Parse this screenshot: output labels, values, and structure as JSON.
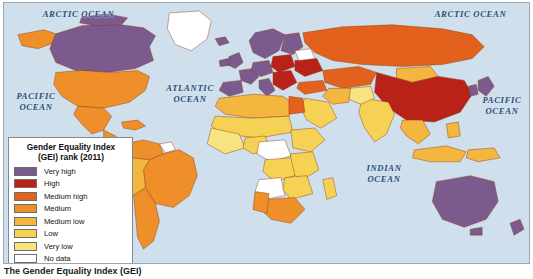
{
  "map": {
    "title": "Gender Equality Index (GEI) rank (2011)",
    "caption": "The Gender Equality Index (GEI)",
    "ocean_color": "#cfe0ec",
    "border_color": "#9aa7b4",
    "ocean_labels": [
      {
        "name": "arctic-ocean-west",
        "text": "ARCTIC  OCEAN"
      },
      {
        "name": "arctic-ocean-east",
        "text": "ARCTIC  OCEAN"
      },
      {
        "name": "pacific-ocean-west",
        "text": "PACIFIC\nOCEAN"
      },
      {
        "name": "pacific-ocean-east",
        "text": "PACIFIC\nOCEAN"
      },
      {
        "name": "atlantic-ocean",
        "text": "ATLANTIC\nOCEAN"
      },
      {
        "name": "indian-ocean",
        "text": "INDIAN\nOCEAN"
      }
    ]
  },
  "legend": {
    "title": "Gender Equality Index\n(GEI) rank (2011)",
    "items": [
      {
        "label": "Very high",
        "color": "#7b5a8e"
      },
      {
        "label": "High",
        "color": "#b92219"
      },
      {
        "label": "Medium high",
        "color": "#e2611c"
      },
      {
        "label": "Medium",
        "color": "#ef8f2a"
      },
      {
        "label": "Medium low",
        "color": "#f3b63f"
      },
      {
        "label": "Low",
        "color": "#f6d254"
      },
      {
        "label": "Very low",
        "color": "#f7e37f"
      },
      {
        "label": "No data",
        "color": "#ffffff"
      }
    ]
  },
  "chart_data": {
    "type": "map",
    "title": "Gender Equality Index (GEI) rank (2011)",
    "projection": "world-choropleth",
    "classes": [
      "Very high",
      "High",
      "Medium high",
      "Medium",
      "Medium low",
      "Low",
      "Very low",
      "No data"
    ],
    "class_colors": [
      "#7b5a8e",
      "#b92219",
      "#e2611c",
      "#ef8f2a",
      "#f3b63f",
      "#f6d254",
      "#f7e37f",
      "#ffffff"
    ],
    "regions": [
      {
        "name": "Canada",
        "class": "Very high"
      },
      {
        "name": "Greenland",
        "class": "No data"
      },
      {
        "name": "United States",
        "class": "Medium"
      },
      {
        "name": "Alaska",
        "class": "Medium"
      },
      {
        "name": "Mexico",
        "class": "Medium"
      },
      {
        "name": "Central America",
        "class": "Medium"
      },
      {
        "name": "Caribbean",
        "class": "Medium"
      },
      {
        "name": "Brazil",
        "class": "Medium"
      },
      {
        "name": "Argentina",
        "class": "Medium"
      },
      {
        "name": "Chile",
        "class": "Medium"
      },
      {
        "name": "Peru",
        "class": "Medium low"
      },
      {
        "name": "Bolivia",
        "class": "Medium low"
      },
      {
        "name": "Colombia",
        "class": "Medium"
      },
      {
        "name": "Venezuela",
        "class": "Medium"
      },
      {
        "name": "Guyana region",
        "class": "No data"
      },
      {
        "name": "Western Europe",
        "class": "Very high"
      },
      {
        "name": "Scandinavia",
        "class": "Very high"
      },
      {
        "name": "United Kingdom",
        "class": "Very high"
      },
      {
        "name": "France",
        "class": "Very high"
      },
      {
        "name": "Spain",
        "class": "Very high"
      },
      {
        "name": "Italy",
        "class": "Very high"
      },
      {
        "name": "Germany",
        "class": "Very high"
      },
      {
        "name": "Poland",
        "class": "High"
      },
      {
        "name": "Balkans",
        "class": "High"
      },
      {
        "name": "Ukraine",
        "class": "High"
      },
      {
        "name": "Belarus",
        "class": "No data"
      },
      {
        "name": "Russia",
        "class": "Medium high"
      },
      {
        "name": "Kazakhstan",
        "class": "Medium high"
      },
      {
        "name": "Mongolia",
        "class": "Medium low"
      },
      {
        "name": "China",
        "class": "High"
      },
      {
        "name": "Japan",
        "class": "Very high"
      },
      {
        "name": "Korea",
        "class": "Very high"
      },
      {
        "name": "India",
        "class": "Low"
      },
      {
        "name": "Pakistan",
        "class": "Very low"
      },
      {
        "name": "Iran",
        "class": "Medium low"
      },
      {
        "name": "Turkey",
        "class": "Medium high"
      },
      {
        "name": "Saudi Arabia",
        "class": "Low"
      },
      {
        "name": "Southeast Asia",
        "class": "Medium low"
      },
      {
        "name": "Indonesia",
        "class": "Medium low"
      },
      {
        "name": "North Africa",
        "class": "Medium low"
      },
      {
        "name": "Egypt",
        "class": "Medium high"
      },
      {
        "name": "Sahel",
        "class": "Low"
      },
      {
        "name": "West Africa",
        "class": "Very low"
      },
      {
        "name": "Central Africa",
        "class": "No data"
      },
      {
        "name": "East Africa",
        "class": "Low"
      },
      {
        "name": "Angola",
        "class": "No data"
      },
      {
        "name": "South Africa",
        "class": "Medium high"
      },
      {
        "name": "Namibia",
        "class": "Medium high"
      },
      {
        "name": "Madagascar",
        "class": "Low"
      },
      {
        "name": "Australia",
        "class": "Very high"
      },
      {
        "name": "New Zealand",
        "class": "Very high"
      }
    ]
  }
}
